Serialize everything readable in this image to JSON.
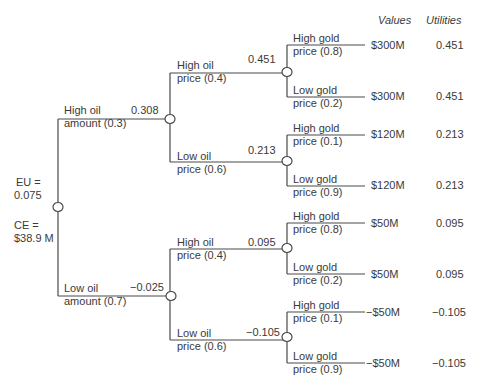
{
  "headers": {
    "values": "Values",
    "utilities": "Utilities"
  },
  "root": {
    "eu_label": "EU =",
    "eu_value": "0.075",
    "ce_label": "CE =",
    "ce_value": "$38.9 M"
  },
  "oil_amount": [
    {
      "label1": "High oil",
      "label2": "amount (0.3)",
      "eu": "0.308"
    },
    {
      "label1": "Low oil",
      "label2": "amount (0.7)",
      "eu": "−0.025"
    }
  ],
  "oil_price": [
    {
      "label1": "High oil",
      "label2": "price (0.4)",
      "eu": "0.451"
    },
    {
      "label1": "Low oil",
      "label2": "price (0.6)",
      "eu": "0.213"
    },
    {
      "label1": "High oil",
      "label2": "price (0.4)",
      "eu": "0.095"
    },
    {
      "label1": "Low oil",
      "label2": "price (0.6)",
      "eu": "−0.105"
    }
  ],
  "gold_price": [
    {
      "label1": "High gold",
      "label2": "price (0.8)",
      "value": "$300M",
      "utility": "0.451"
    },
    {
      "label1": "Low gold",
      "label2": "price (0.2)",
      "value": "$300M",
      "utility": "0.451"
    },
    {
      "label1": "High gold",
      "label2": "price (0.1)",
      "value": "$120M",
      "utility": "0.213"
    },
    {
      "label1": "Low gold",
      "label2": "price (0.9)",
      "value": "$120M",
      "utility": "0.213"
    },
    {
      "label1": "High gold",
      "label2": "price (0.8)",
      "value": "$50M",
      "utility": "0.095"
    },
    {
      "label1": "Low gold",
      "label2": "price (0.2)",
      "value": "$50M",
      "utility": "0.095"
    },
    {
      "label1": "High gold",
      "label2": "price (0.1)",
      "value": "−$50M",
      "utility": "−0.105"
    },
    {
      "label1": "Low gold",
      "label2": "price (0.9)",
      "value": "−$50M",
      "utility": "−0.105"
    }
  ],
  "colors": {
    "line": "#4a4a4a",
    "text": "#3a3a3a",
    "node_fill": "#ffffff"
  }
}
